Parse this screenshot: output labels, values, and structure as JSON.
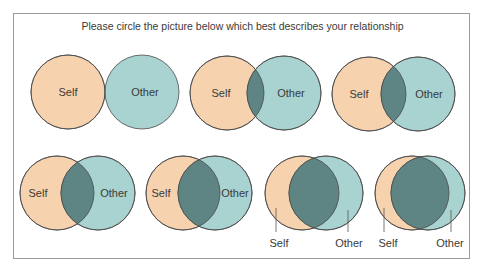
{
  "title": "Please circle the picture below which best describes your relationship",
  "colors": {
    "self_fill": "#f6d3ae",
    "other_fill": "#a8d3d1",
    "overlap_fill": "#5e8583",
    "stroke": "#4a4a4a",
    "frame": "#9a9a9a"
  },
  "radius": 37,
  "options": [
    {
      "id": 1,
      "self": {
        "cx": 68,
        "cy": 92
      },
      "other": {
        "cx": 142,
        "cy": 92
      },
      "self_label": "Self",
      "other_label": "Other",
      "label_style": "inside"
    },
    {
      "id": 2,
      "self": {
        "cx": 227,
        "cy": 93
      },
      "other": {
        "cx": 284,
        "cy": 93
      },
      "self_label": "Self",
      "other_label": "Other",
      "label_style": "inside"
    },
    {
      "id": 3,
      "self": {
        "cx": 369,
        "cy": 94
      },
      "other": {
        "cx": 418,
        "cy": 94
      },
      "self_label": "Self",
      "other_label": "Other",
      "label_style": "inside"
    },
    {
      "id": 4,
      "self": {
        "cx": 57,
        "cy": 193
      },
      "other": {
        "cx": 98,
        "cy": 193
      },
      "self_label": "Self",
      "other_label": "Other",
      "label_style": "inside"
    },
    {
      "id": 5,
      "self": {
        "cx": 183,
        "cy": 193
      },
      "other": {
        "cx": 215,
        "cy": 193
      },
      "self_label": "Self",
      "other_label": "Other",
      "label_style": "inside"
    },
    {
      "id": 6,
      "self": {
        "cx": 302,
        "cy": 193
      },
      "other": {
        "cx": 326,
        "cy": 193
      },
      "self_label": "Self",
      "other_label": "Other",
      "label_style": "below"
    },
    {
      "id": 7,
      "self": {
        "cx": 412,
        "cy": 193
      },
      "other": {
        "cx": 428,
        "cy": 193
      },
      "self_label": "Self",
      "other_label": "Other",
      "label_style": "below"
    }
  ]
}
